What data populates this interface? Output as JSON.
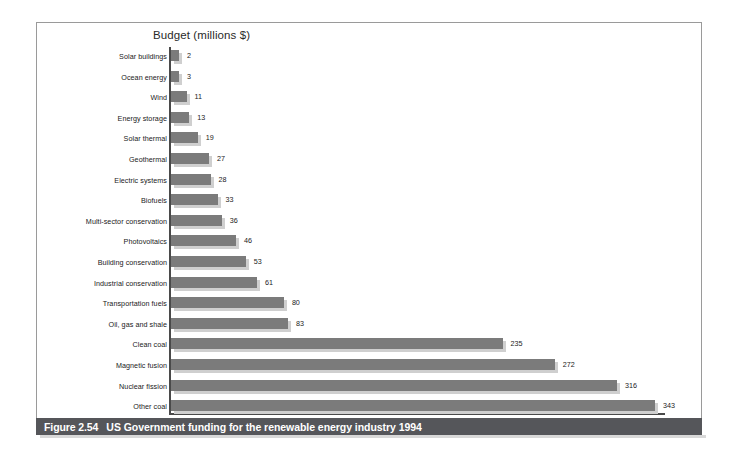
{
  "figure": {
    "caption_number": "Figure 2.54",
    "caption_text": "US Government funding for the renewable energy industry 1994"
  },
  "chart_data": {
    "type": "bar",
    "orientation": "horizontal",
    "title": "Budget (millions $)",
    "xlabel": "",
    "ylabel": "",
    "xlim": [
      0,
      343
    ],
    "grid": false,
    "legend": "none",
    "value_labels": true,
    "colors": {
      "bar_fill": "#7b7b7b",
      "bar_shadow": "#cfcfcf",
      "axis": "#4a4a4a",
      "caption_bar": "#55565a",
      "caption_text": "#ffffff",
      "frame_border": "#9a9a9a",
      "background": "#ffffff"
    },
    "categories": [
      "Solar buildings",
      "Ocean energy",
      "Wind",
      "Energy storage",
      "Solar thermal",
      "Geothermal",
      "Electric systems",
      "Biofuels",
      "Multi-sector conservation",
      "Photovoltaics",
      "Building conservation",
      "Industrial conservation",
      "Transportation fuels",
      "Oil, gas and shale",
      "Clean coal",
      "Magnetic fusion",
      "Nuclear fission",
      "Other coal"
    ],
    "values": [
      2,
      3,
      11,
      13,
      19,
      27,
      28,
      33,
      36,
      46,
      53,
      61,
      80,
      83,
      235,
      272,
      316,
      343
    ]
  }
}
